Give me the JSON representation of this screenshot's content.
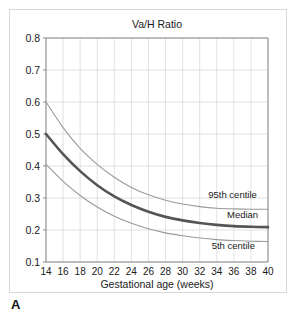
{
  "figure": {
    "panel_label": "A"
  },
  "chart_data": {
    "type": "line",
    "title": "Va/H Ratio",
    "xlabel": "Gestational age (weeks)",
    "ylabel": "",
    "xlim": [
      14,
      40
    ],
    "ylim": [
      0.1,
      0.8
    ],
    "grid": true,
    "legend_position": "inline-right",
    "xticks": [
      14,
      16,
      18,
      20,
      22,
      24,
      26,
      28,
      30,
      32,
      34,
      36,
      38,
      40
    ],
    "xtick_labels": [
      "14",
      "16",
      "18",
      "20",
      "22",
      "24",
      "26",
      "28",
      "30",
      "32",
      "34",
      "36",
      "38",
      "40"
    ],
    "yticks": [
      0.1,
      0.2,
      0.3,
      0.4,
      0.5,
      0.6,
      0.7,
      0.8
    ],
    "ytick_labels": [
      "0.1",
      "0.2",
      "0.3",
      "0.4",
      "0.5",
      "0.6",
      "0.7",
      "0.8"
    ],
    "x": [
      14,
      16,
      18,
      20,
      22,
      24,
      26,
      28,
      30,
      32,
      34,
      36,
      38,
      40
    ],
    "series": [
      {
        "name": "95th centile",
        "color": "#9a9a9a",
        "values": [
          0.6,
          0.52,
          0.455,
          0.405,
          0.365,
          0.333,
          0.31,
          0.293,
          0.281,
          0.273,
          0.268,
          0.266,
          0.265,
          0.265
        ]
      },
      {
        "name": "Median",
        "color": "#555555",
        "values": [
          0.5,
          0.437,
          0.384,
          0.34,
          0.305,
          0.278,
          0.257,
          0.241,
          0.23,
          0.222,
          0.216,
          0.212,
          0.21,
          0.209
        ]
      },
      {
        "name": "5th centile",
        "color": "#9a9a9a",
        "values": [
          0.405,
          0.352,
          0.308,
          0.272,
          0.243,
          0.221,
          0.204,
          0.191,
          0.182,
          0.175,
          0.17,
          0.167,
          0.165,
          0.164
        ]
      }
    ],
    "annotations": [
      {
        "text": "95th centile",
        "x": 33.0,
        "y": 0.3
      },
      {
        "text": "Median",
        "x": 35.2,
        "y": 0.237
      },
      {
        "text": "5th centile",
        "x": 33.4,
        "y": 0.142
      }
    ]
  }
}
